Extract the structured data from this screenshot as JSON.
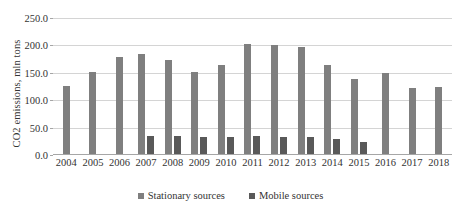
{
  "chart_data": {
    "type": "bar",
    "title": "",
    "subtitle": "",
    "xlabel": "",
    "ylabel": "CO2 emissions, mln tons",
    "ylim": [
      0,
      250
    ],
    "ytick_step": 50,
    "ytick_labels": [
      "0.0",
      "50.0",
      "100.0",
      "150.0",
      "200.0",
      "250.0"
    ],
    "ytick_values": [
      0,
      50,
      100,
      150,
      200,
      250
    ],
    "grid": true,
    "legend_position": "bottom",
    "categories": [
      "2004",
      "2005",
      "2006",
      "2007",
      "2008",
      "2009",
      "2010",
      "2011",
      "2012",
      "2013",
      "2014",
      "2015",
      "2016",
      "2017",
      "2018"
    ],
    "series": [
      {
        "name": "Stationary sources",
        "color": "#7f7f7f",
        "values": [
          126,
          152,
          178,
          184,
          173,
          152,
          164,
          203,
          200,
          198,
          165,
          139,
          150,
          123,
          125
        ]
      },
      {
        "name": "Mobile sources",
        "color": "#595959",
        "values": [
          null,
          null,
          null,
          34,
          34,
          32,
          33,
          34,
          33,
          33,
          29,
          24,
          null,
          null,
          null
        ]
      }
    ]
  }
}
